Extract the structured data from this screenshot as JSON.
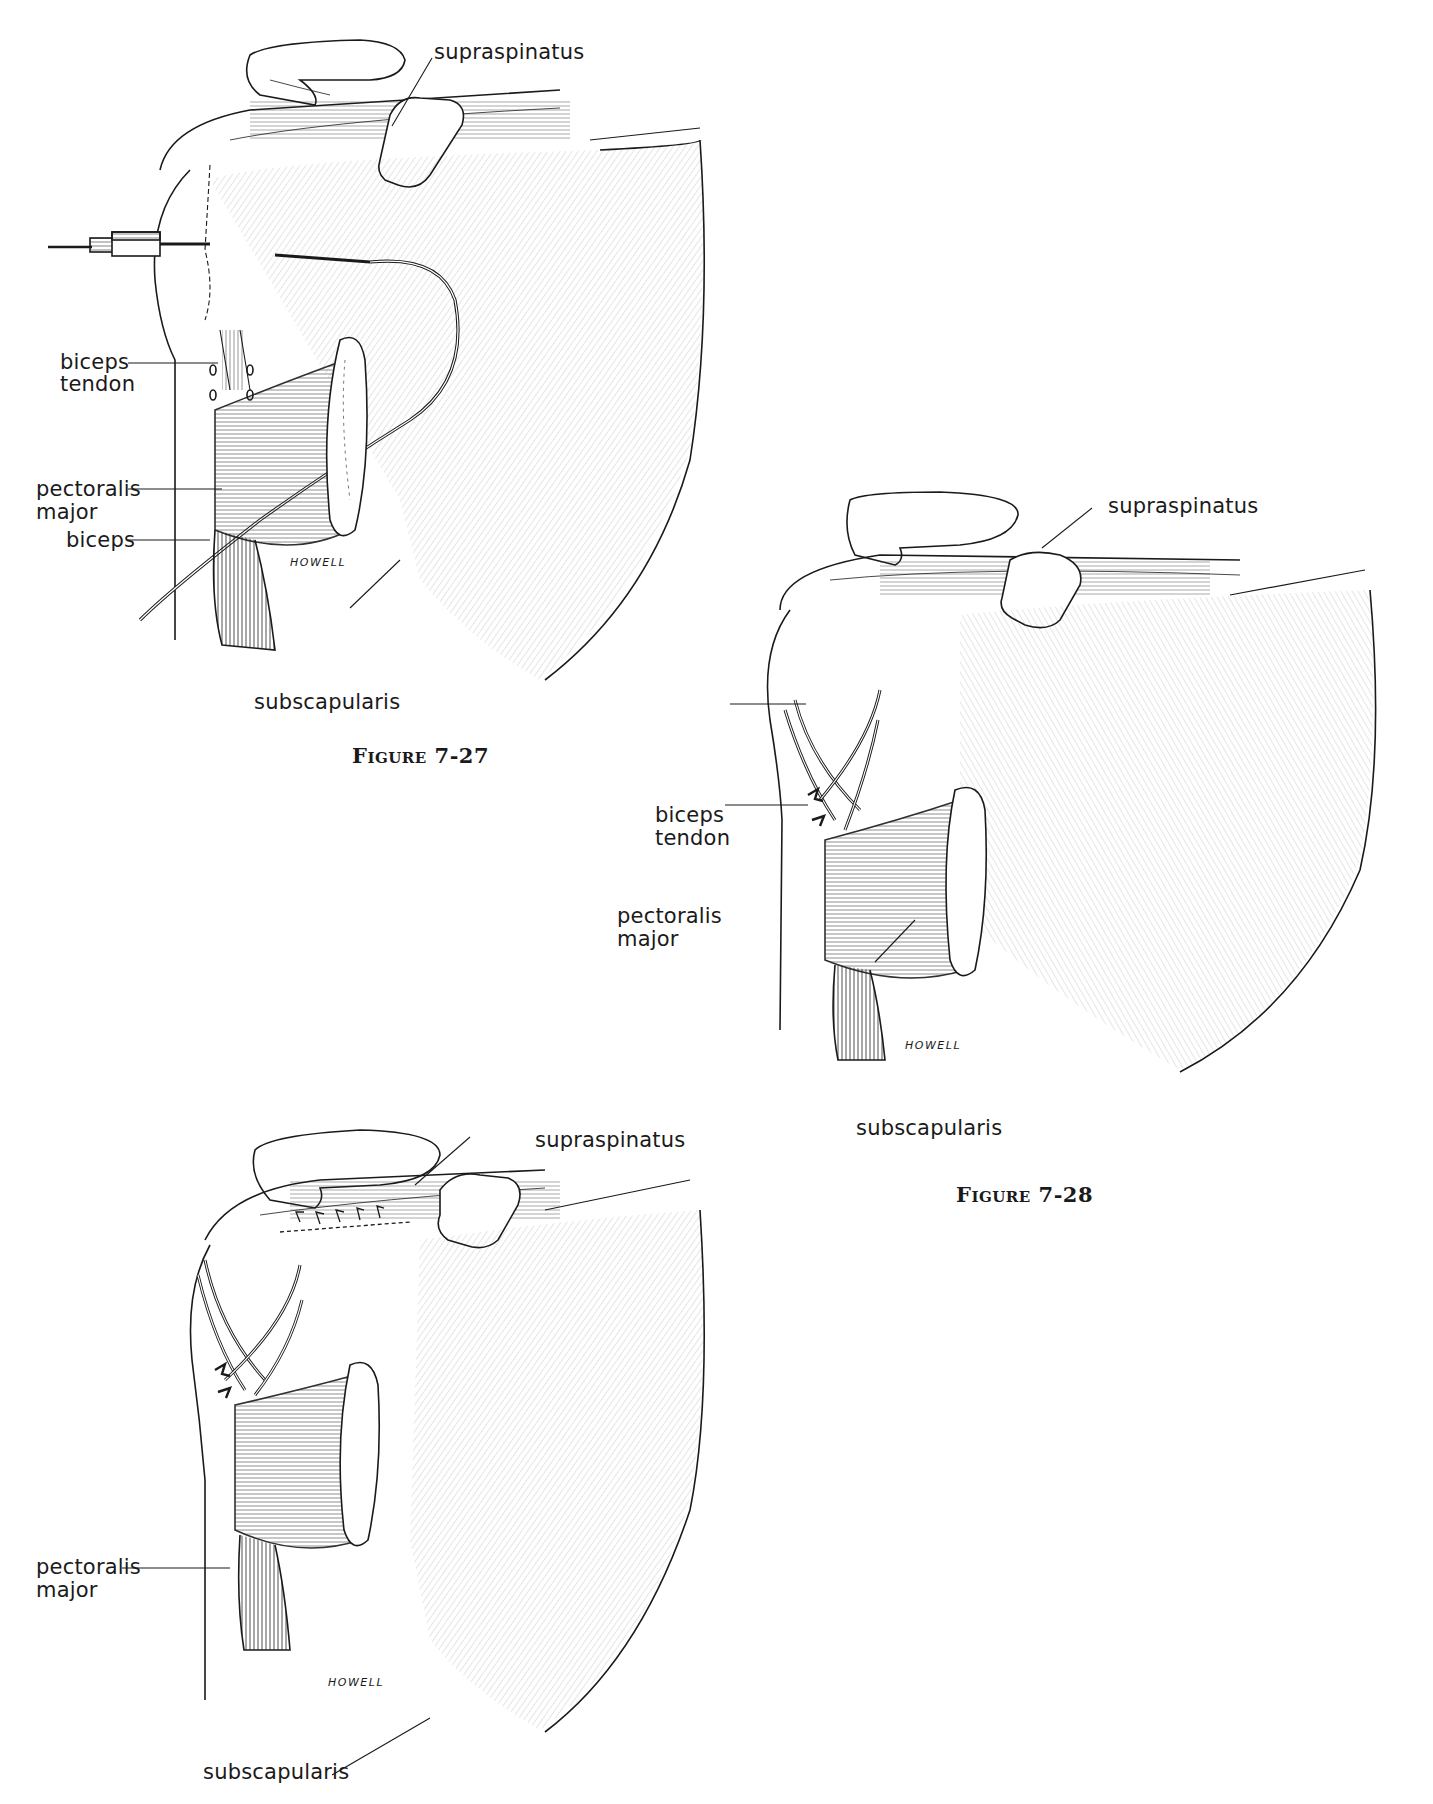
{
  "page": {
    "background": "#ffffff",
    "ink_color": "#1a1a1a"
  },
  "figures": [
    {
      "id": "fig-7-27",
      "caption": "Figure 7-27",
      "signature": "HOWELL",
      "labels": {
        "supraspinatus": "supraspinatus",
        "biceps_tendon_1": "biceps",
        "biceps_tendon_2": "tendon",
        "pectoralis_major_1": "pectoralis",
        "pectoralis_major_2": "major",
        "biceps": "biceps",
        "subscapularis": "subscapularis"
      }
    },
    {
      "id": "fig-7-28",
      "caption": "Figure 7-28",
      "signature": "HOWELL",
      "labels": {
        "supraspinatus": "supraspinatus",
        "biceps_tendon_1": "biceps",
        "biceps_tendon_2": "tendon",
        "pectoralis_major_1": "pectoralis",
        "pectoralis_major_2": "major",
        "subscapularis": "subscapularis"
      }
    },
    {
      "id": "fig-7-29",
      "caption": "",
      "signature": "HOWELL",
      "labels": {
        "supraspinatus": "supraspinatus",
        "pectoralis_major_1": "pectoralis",
        "pectoralis_major_2": "major",
        "subscapularis": "subscapularis"
      }
    }
  ]
}
